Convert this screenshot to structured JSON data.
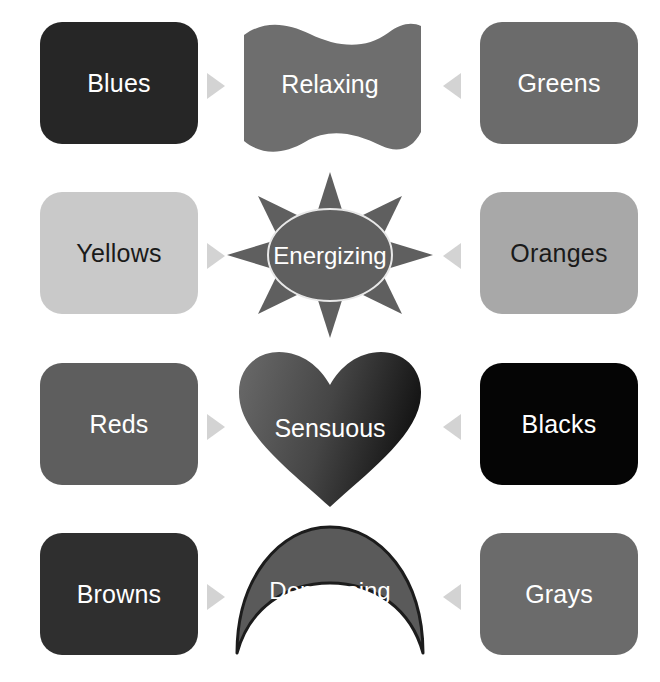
{
  "diagram": {
    "background": "#ffffff",
    "arrow_color": "#d3d3d3",
    "rows": [
      {
        "left_chip": {
          "label": "Blues",
          "fill": "#262626",
          "text_color": "#ffffff"
        },
        "center": {
          "label": "Relaxing",
          "shape": "wave-ribbon",
          "fill": "#6e6e6e",
          "text_color": "#ffffff"
        },
        "right_chip": {
          "label": "Greens",
          "fill": "#6b6b6b",
          "text_color": "#ffffff"
        },
        "left_arrow": "arrow-right-icon",
        "right_arrow": "arrow-left-icon"
      },
      {
        "left_chip": {
          "label": "Yellows",
          "fill": "#c9c9c9",
          "text_color": "#1a1a1a"
        },
        "center": {
          "label": "Energizing",
          "shape": "sun-starburst",
          "fill": "#5f5f5f",
          "text_color": "#ffffff"
        },
        "right_chip": {
          "label": "Oranges",
          "fill": "#a8a8a8",
          "text_color": "#1a1a1a"
        },
        "left_arrow": "arrow-right-icon",
        "right_arrow": "arrow-left-icon"
      },
      {
        "left_chip": {
          "label": "Reds",
          "fill": "#5e5e5e",
          "text_color": "#ffffff"
        },
        "center": {
          "label": "Sensuous",
          "shape": "heart",
          "fill": "#3b3b3b",
          "text_color": "#ffffff"
        },
        "right_chip": {
          "label": "Blacks",
          "fill": "#050505",
          "text_color": "#ffffff"
        },
        "left_arrow": "arrow-right-icon",
        "right_arrow": "arrow-left-icon"
      },
      {
        "left_chip": {
          "label": "Browns",
          "fill": "#2f2f2f",
          "text_color": "#ffffff"
        },
        "center": {
          "label": "Depressing",
          "shape": "crescent-moon",
          "fill": "#5a5a5a",
          "text_color": "#ffffff"
        },
        "right_chip": {
          "label": "Grays",
          "fill": "#6b6b6b",
          "text_color": "#ffffff"
        },
        "left_arrow": "arrow-right-icon",
        "right_arrow": "arrow-left-icon"
      }
    ]
  }
}
